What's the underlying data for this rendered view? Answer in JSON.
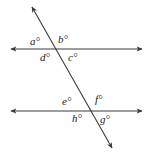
{
  "figure": {
    "canvas": {
      "width": 157,
      "height": 156,
      "background": "#ffffff"
    },
    "stroke_color": "#3a3a3a",
    "text_color": "#1a1a1a",
    "lines": [
      {
        "name": "upper-parallel-line",
        "x1": 11,
        "y1": 49,
        "x2": 142,
        "y2": 49,
        "arrow_start": true,
        "arrow_end": true
      },
      {
        "name": "lower-parallel-line",
        "x1": 11,
        "y1": 111,
        "x2": 142,
        "y2": 111,
        "arrow_start": true,
        "arrow_end": true
      },
      {
        "name": "transversal-line",
        "x1": 32,
        "y1": 7,
        "x2": 112,
        "y2": 148,
        "arrow_start": true,
        "arrow_end": true
      }
    ],
    "intersections": [
      {
        "name": "upper-intersection",
        "x": 59,
        "y": 49
      },
      {
        "name": "lower-intersection",
        "x": 93,
        "y": 111
      }
    ],
    "angle_labels": [
      {
        "id": "a",
        "text": "a°",
        "x": 30,
        "y": 36,
        "position": "upper-intersection-upper-left"
      },
      {
        "id": "b",
        "text": "b°",
        "x": 58,
        "y": 34,
        "position": "upper-intersection-upper-right"
      },
      {
        "id": "d",
        "text": "d°",
        "x": 40,
        "y": 52,
        "position": "upper-intersection-lower-left"
      },
      {
        "id": "c",
        "text": "c°",
        "x": 68,
        "y": 52,
        "position": "upper-intersection-lower-right"
      },
      {
        "id": "e",
        "text": "e°",
        "x": 62,
        "y": 96,
        "position": "lower-intersection-upper-left"
      },
      {
        "id": "f",
        "text": "f°",
        "x": 95,
        "y": 94,
        "position": "lower-intersection-upper-right"
      },
      {
        "id": "h",
        "text": "h°",
        "x": 72,
        "y": 113,
        "position": "lower-intersection-lower-left"
      },
      {
        "id": "g",
        "text": "g°",
        "x": 100,
        "y": 114,
        "position": "lower-intersection-lower-right"
      }
    ]
  }
}
